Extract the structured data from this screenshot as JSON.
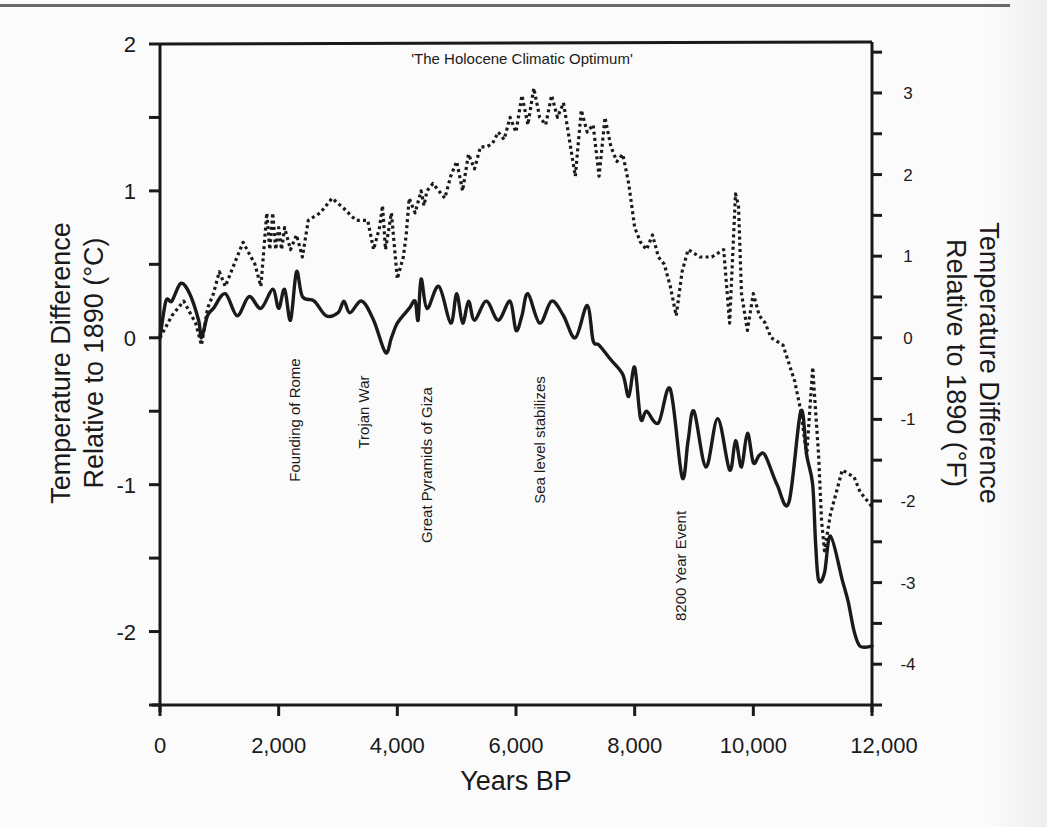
{
  "chart_data": {
    "type": "line",
    "title": "'The Holocene Climatic Optimum'",
    "xlabel": "Years BP",
    "ylabel": "Temperature Difference Relative to 1890 (°C)",
    "ylabel_line1": "Temperature Difference",
    "ylabel_line2": "Relative to 1890 (°C)",
    "y2label": "Temperature Difference Relative to 1890 (°F)",
    "y2label_line1": "Temperature Difference",
    "y2label_line2": "Relative to 1890 (°F)",
    "xlim": [
      0,
      12000
    ],
    "ylim": [
      -2.5,
      2
    ],
    "y2lim": [
      -4.5,
      3.6
    ],
    "grid": false,
    "legend": null,
    "x_ticks": [
      "0",
      "2,000",
      "4,000",
      "6,000",
      "8,000",
      "10,000",
      "12,000"
    ],
    "y_ticks": [
      "2",
      "1",
      "0",
      "-1",
      "-2"
    ],
    "y2_ticks": [
      "3",
      "2",
      "1",
      "0",
      "-1",
      "-2",
      "-3",
      "-4"
    ],
    "series": [
      {
        "name": "solid",
        "style": "solid",
        "x": [
          0,
          100,
          200,
          350,
          500,
          650,
          700,
          800,
          900,
          1100,
          1300,
          1500,
          1700,
          1900,
          2000,
          2100,
          2200,
          2300,
          2400,
          2600,
          2800,
          3000,
          3100,
          3200,
          3400,
          3600,
          3800,
          3900,
          4000,
          4200,
          4300,
          4350,
          4400,
          4500,
          4700,
          4900,
          5000,
          5100,
          5200,
          5300,
          5500,
          5700,
          5900,
          6000,
          6100,
          6200,
          6400,
          6600,
          6800,
          7000,
          7200,
          7300,
          7400,
          7600,
          7800,
          7900,
          8000,
          8100,
          8200,
          8400,
          8600,
          8800,
          8900,
          9000,
          9200,
          9400,
          9600,
          9700,
          9800,
          9900,
          10000,
          10100,
          10200,
          10400,
          10600,
          10800,
          10900,
          11000,
          11050,
          11100,
          11200,
          11300,
          11500,
          11600,
          11700,
          11800,
          12000
        ],
        "values": [
          0.0,
          0.25,
          0.25,
          0.37,
          0.3,
          0.12,
          0.0,
          0.15,
          0.2,
          0.3,
          0.15,
          0.28,
          0.2,
          0.33,
          0.2,
          0.33,
          0.12,
          0.45,
          0.28,
          0.25,
          0.15,
          0.17,
          0.25,
          0.17,
          0.25,
          0.12,
          -0.1,
          0.0,
          0.1,
          0.2,
          0.25,
          0.12,
          0.4,
          0.2,
          0.35,
          0.1,
          0.3,
          0.1,
          0.25,
          0.12,
          0.25,
          0.12,
          0.25,
          0.05,
          0.15,
          0.3,
          0.1,
          0.25,
          0.15,
          0.0,
          0.22,
          -0.02,
          -0.05,
          -0.15,
          -0.25,
          -0.4,
          -0.2,
          -0.55,
          -0.5,
          -0.58,
          -0.35,
          -0.95,
          -0.7,
          -0.5,
          -0.88,
          -0.55,
          -0.9,
          -0.7,
          -0.88,
          -0.65,
          -0.85,
          -0.8,
          -0.8,
          -1.0,
          -1.12,
          -0.5,
          -0.8,
          -1.0,
          -1.4,
          -1.65,
          -1.6,
          -1.35,
          -1.65,
          -1.8,
          -2.0,
          -2.1,
          -2.1
        ]
      },
      {
        "name": "dotted",
        "style": "dotted",
        "x": [
          0,
          200,
          400,
          600,
          700,
          800,
          900,
          1000,
          1100,
          1300,
          1400,
          1600,
          1700,
          1800,
          1850,
          1900,
          1950,
          2000,
          2050,
          2100,
          2200,
          2300,
          2400,
          2500,
          2700,
          2900,
          3100,
          3300,
          3500,
          3600,
          3700,
          3750,
          3800,
          3900,
          4000,
          4100,
          4150,
          4200,
          4300,
          4400,
          4450,
          4500,
          4600,
          4800,
          4900,
          5000,
          5100,
          5200,
          5300,
          5400,
          5500,
          5600,
          5700,
          5800,
          5900,
          6000,
          6100,
          6200,
          6300,
          6400,
          6500,
          6600,
          6700,
          6800,
          6900,
          7000,
          7100,
          7200,
          7300,
          7400,
          7500,
          7600,
          7700,
          7800,
          7900,
          8000,
          8100,
          8200,
          8300,
          8400,
          8500,
          8600,
          8700,
          8800,
          8900,
          9100,
          9300,
          9500,
          9600,
          9700,
          9750,
          9800,
          9900,
          10000,
          10100,
          10200,
          10300,
          10500,
          10700,
          10800,
          10900,
          11000,
          11050,
          11100,
          11150,
          11200,
          11300,
          11500,
          11700,
          11800,
          12000
        ],
        "values": [
          0.0,
          0.15,
          0.25,
          0.1,
          -0.05,
          0.2,
          0.3,
          0.45,
          0.35,
          0.55,
          0.65,
          0.5,
          0.35,
          0.85,
          0.6,
          0.85,
          0.6,
          0.75,
          0.6,
          0.75,
          0.6,
          0.7,
          0.55,
          0.8,
          0.85,
          0.95,
          0.88,
          0.8,
          0.8,
          0.6,
          0.75,
          0.9,
          0.6,
          0.85,
          0.4,
          0.55,
          0.7,
          0.95,
          0.85,
          1.0,
          0.9,
          1.0,
          1.05,
          0.95,
          1.1,
          1.2,
          1.0,
          1.25,
          1.15,
          1.3,
          1.3,
          1.32,
          1.4,
          1.35,
          1.5,
          1.4,
          1.65,
          1.45,
          1.7,
          1.5,
          1.45,
          1.65,
          1.5,
          1.6,
          1.35,
          1.1,
          1.55,
          1.4,
          1.45,
          1.1,
          1.5,
          1.3,
          1.2,
          1.25,
          1.05,
          0.75,
          0.65,
          0.6,
          0.7,
          0.55,
          0.5,
          0.35,
          0.15,
          0.45,
          0.6,
          0.55,
          0.55,
          0.6,
          0.1,
          0.98,
          0.9,
          0.3,
          0.05,
          0.3,
          0.15,
          0.1,
          0.0,
          -0.05,
          -0.3,
          -0.5,
          -0.8,
          -0.2,
          -0.5,
          -0.8,
          -1.25,
          -1.45,
          -1.2,
          -0.9,
          -0.95,
          -1.05,
          -1.15
        ]
      }
    ],
    "annotations": [
      {
        "text": "Founding of Rome",
        "x": 2300,
        "orientation": "vertical"
      },
      {
        "text": "Trojan War",
        "x": 3400,
        "orientation": "vertical"
      },
      {
        "text": "Great Pyramids of Giza",
        "x": 4500,
        "orientation": "vertical"
      },
      {
        "text": "Sea level stabilizes",
        "x": 6400,
        "orientation": "vertical"
      },
      {
        "text": "8200 Year Event",
        "x": 8700,
        "orientation": "vertical"
      }
    ]
  },
  "labels": {
    "title": "'The Holocene Climatic Optimum'",
    "xlabel": "Years BP",
    "ylabel_line1": "Temperature Difference",
    "ylabel_line2": "Relative to 1890 (°C)",
    "y2label_line1": "Temperature Difference",
    "y2label_line2": "Relative to 1890 (°F)",
    "x_ticks": [
      "0",
      "2,000",
      "4,000",
      "6,000",
      "8,000",
      "10,000",
      "12,000"
    ],
    "y_ticks": [
      "2",
      "1",
      "0",
      "-1",
      "-2"
    ],
    "y2_ticks": [
      "3",
      "2",
      "1",
      "0",
      "-1",
      "-2",
      "-3",
      "-4"
    ],
    "annotations": [
      "Founding of Rome",
      "Trojan War",
      "Great Pyramids of Giza",
      "Sea level stabilizes",
      "8200 Year Event"
    ]
  }
}
